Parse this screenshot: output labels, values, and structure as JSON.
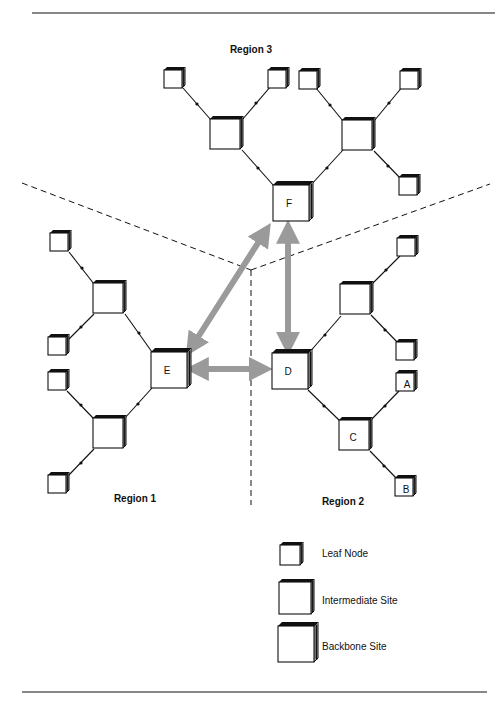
{
  "figure": {
    "regions": [
      {
        "id": "region3",
        "label": "Region 3",
        "x": 251,
        "y": 53
      },
      {
        "id": "region1",
        "label": "Region 1",
        "x": 135,
        "y": 502
      },
      {
        "id": "region2",
        "label": "Region 2",
        "x": 343,
        "y": 505
      }
    ],
    "backbone_sites": [
      {
        "id": "F",
        "label": "F",
        "x": 273,
        "y": 185,
        "size": 36
      },
      {
        "id": "E",
        "label": "E",
        "x": 151,
        "y": 352,
        "size": 36
      },
      {
        "id": "D",
        "label": "D",
        "x": 272,
        "y": 353,
        "size": 36
      }
    ],
    "intermediate_sites": [
      {
        "id": "r3-left",
        "label": "",
        "x": 210,
        "y": 119,
        "size": 32
      },
      {
        "id": "r3-right",
        "label": "",
        "x": 342,
        "y": 120,
        "size": 32
      },
      {
        "id": "r1-top",
        "label": "",
        "x": 93,
        "y": 283,
        "size": 32
      },
      {
        "id": "r1-bottom",
        "label": "",
        "x": 93,
        "y": 418,
        "size": 32
      },
      {
        "id": "r2-top",
        "label": "",
        "x": 340,
        "y": 284,
        "size": 32
      },
      {
        "id": "C",
        "label": "C",
        "x": 339,
        "y": 420,
        "size": 32
      }
    ],
    "leaf_nodes": [
      {
        "id": "r3-l1",
        "label": "",
        "x": 166,
        "y": 70,
        "size": 20
      },
      {
        "id": "r3-l2",
        "label": "",
        "x": 270,
        "y": 70,
        "size": 20
      },
      {
        "id": "r3-l3",
        "label": "",
        "x": 301,
        "y": 71,
        "size": 20
      },
      {
        "id": "r3-l4",
        "label": "",
        "x": 402,
        "y": 71,
        "size": 20
      },
      {
        "id": "r3-l5",
        "label": "",
        "x": 401,
        "y": 177,
        "size": 20
      },
      {
        "id": "r1-l1",
        "label": "",
        "x": 52,
        "y": 233,
        "size": 20
      },
      {
        "id": "r1-l2",
        "label": "",
        "x": 50,
        "y": 337,
        "size": 20
      },
      {
        "id": "r1-l3",
        "label": "",
        "x": 50,
        "y": 372,
        "size": 20
      },
      {
        "id": "r1-l4",
        "label": "",
        "x": 50,
        "y": 475,
        "size": 20
      },
      {
        "id": "r2-l1",
        "label": "",
        "x": 399,
        "y": 238,
        "size": 20
      },
      {
        "id": "r2-l2",
        "label": "",
        "x": 398,
        "y": 342,
        "size": 20
      },
      {
        "id": "A",
        "label": "A",
        "x": 398,
        "y": 373,
        "size": 20
      },
      {
        "id": "B",
        "label": "B",
        "x": 397,
        "y": 478,
        "size": 20
      }
    ],
    "node_labels": {
      "F": "F",
      "E": "E",
      "D": "D",
      "C": "C",
      "A": "A",
      "B": "B"
    },
    "legend": [
      {
        "type": "leaf",
        "label": "Leaf Node"
      },
      {
        "type": "intermediate",
        "label": "Intermediate Site"
      },
      {
        "type": "backbone",
        "label": "Backbone Site"
      }
    ],
    "colors": {
      "line": "#111111",
      "backbone_link": "#9a9a9a",
      "box_fill": "#ffffff",
      "box_edge": "#111111"
    }
  }
}
